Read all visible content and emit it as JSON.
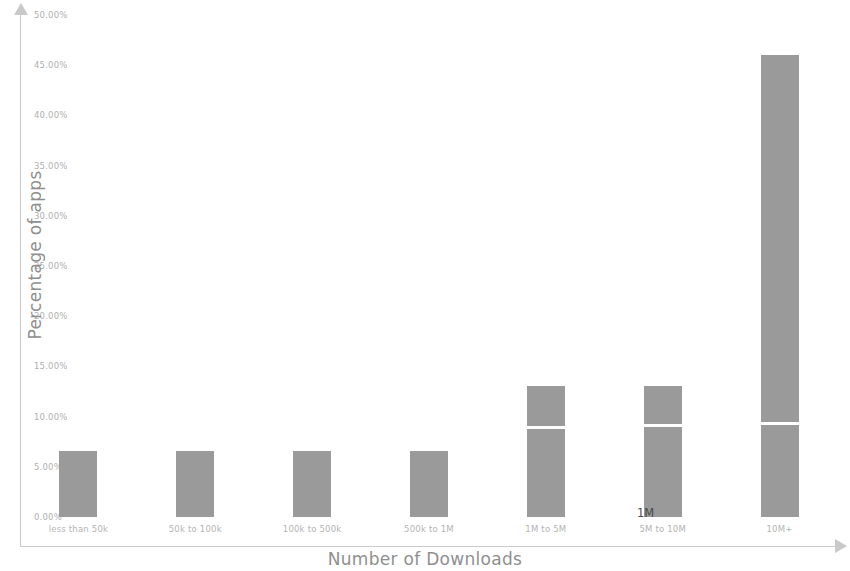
{
  "chart_data": {
    "type": "bar",
    "title": "",
    "xlabel": "Number of Downloads",
    "ylabel": "Percentage of apps",
    "categories": [
      "less than 50k",
      "50k to 100k",
      "100k to 500k",
      "500k to 1M",
      "1M to 5M",
      "5M to 10M",
      "10M+"
    ],
    "values": [
      6.6,
      6.6,
      6.6,
      6.6,
      13.0,
      13.0,
      46.0
    ],
    "segment_markers": [
      null,
      null,
      null,
      null,
      8.8,
      9.0,
      9.2
    ],
    "ylim": [
      0,
      50
    ],
    "ytick_labels": [
      "50.00%",
      "45.00%",
      "40.00%",
      "35.00%",
      "30.00%",
      "25.00%",
      "20.00%",
      "15.00%",
      "10.00%",
      "5.00%",
      "0.00%"
    ],
    "ytick_values": [
      50,
      45,
      40,
      35,
      30,
      25,
      20,
      15,
      10,
      5,
      0
    ],
    "grid": false,
    "legend": null,
    "bar_color": "#9a9a9a",
    "marker_color": "#ffffff",
    "axis_color": "#c9c9c9",
    "tick_label_color": "#b4b4b4",
    "axis_title_color": "#8f8f8f",
    "annotations": [
      {
        "text": "1M",
        "x": 637,
        "y": 506
      }
    ]
  }
}
